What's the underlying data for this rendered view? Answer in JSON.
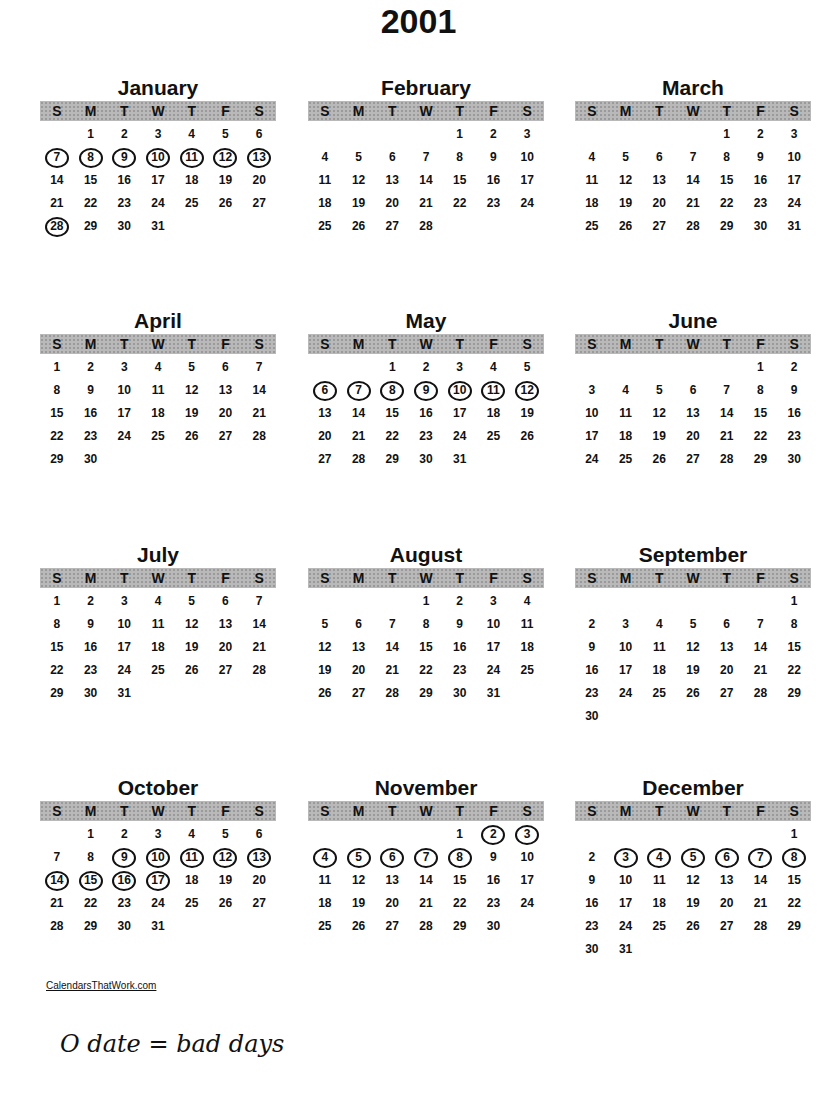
{
  "year": "2001",
  "weekday_headers": [
    "S",
    "M",
    "T",
    "W",
    "T",
    "F",
    "S"
  ],
  "months": [
    {
      "name": "January",
      "start": 1,
      "days": 31,
      "circled": [
        7,
        8,
        9,
        10,
        11,
        12,
        13,
        28
      ]
    },
    {
      "name": "February",
      "start": 4,
      "days": 28,
      "circled": []
    },
    {
      "name": "March",
      "start": 4,
      "days": 31,
      "circled": []
    },
    {
      "name": "April",
      "start": 0,
      "days": 30,
      "circled": []
    },
    {
      "name": "May",
      "start": 2,
      "days": 31,
      "circled": [
        6,
        7,
        8,
        9,
        10,
        11,
        12
      ]
    },
    {
      "name": "June",
      "start": 5,
      "days": 30,
      "circled": []
    },
    {
      "name": "July",
      "start": 0,
      "days": 31,
      "circled": []
    },
    {
      "name": "August",
      "start": 3,
      "days": 31,
      "circled": []
    },
    {
      "name": "September",
      "start": 6,
      "days": 30,
      "circled": []
    },
    {
      "name": "October",
      "start": 1,
      "days": 31,
      "circled": [
        9,
        10,
        11,
        12,
        13,
        14,
        15,
        16,
        17
      ]
    },
    {
      "name": "November",
      "start": 4,
      "days": 30,
      "circled": [
        2,
        3,
        4,
        5,
        6,
        7,
        8
      ]
    },
    {
      "name": "December",
      "start": 6,
      "days": 31,
      "circled": [
        3,
        4,
        5,
        6,
        7,
        8
      ]
    }
  ],
  "footer_link": "CalendarsThatWork.com",
  "handwritten_note": "O date = bad days"
}
